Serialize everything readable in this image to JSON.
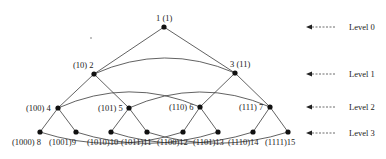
{
  "diagram": {
    "type": "binary-tree-with-cross-links",
    "nodes": [
      {
        "id": 1,
        "label": "1 (1)",
        "x": 164,
        "y": 27,
        "lx": 156,
        "ly": 21,
        "anchor": "start"
      },
      {
        "id": 2,
        "label": "(10) 2",
        "x": 94,
        "y": 74,
        "lx": 73,
        "ly": 68,
        "anchor": "start"
      },
      {
        "id": 3,
        "label": "3 (11)",
        "x": 235,
        "y": 73,
        "lx": 230,
        "ly": 67,
        "anchor": "start"
      },
      {
        "id": 4,
        "label": "(100)  4",
        "x": 58,
        "y": 108,
        "lx": 26,
        "ly": 111,
        "anchor": "start"
      },
      {
        "id": 5,
        "label": "(101) 5",
        "x": 129,
        "y": 108,
        "lx": 98,
        "ly": 111,
        "anchor": "start"
      },
      {
        "id": 6,
        "label": "(110) 6",
        "x": 200,
        "y": 107,
        "lx": 169,
        "ly": 110,
        "anchor": "start"
      },
      {
        "id": 7,
        "label": "(111) 7",
        "x": 270,
        "y": 107,
        "lx": 239,
        "ly": 110,
        "anchor": "start"
      },
      {
        "id": 8,
        "label": "(1000) 8",
        "x": 40,
        "y": 132,
        "lx": 12,
        "ly": 145,
        "anchor": "start"
      },
      {
        "id": 9,
        "label": "(1001)9",
        "x": 76,
        "y": 132,
        "lx": 49,
        "ly": 145,
        "anchor": "start"
      },
      {
        "id": 10,
        "label": "(1010)10",
        "x": 111,
        "y": 132,
        "lx": 87,
        "ly": 145,
        "anchor": "start"
      },
      {
        "id": 11,
        "label": "(1011)11",
        "x": 147,
        "y": 132,
        "lx": 121,
        "ly": 145,
        "anchor": "start"
      },
      {
        "id": 12,
        "label": "(1100)12",
        "x": 183,
        "y": 132,
        "lx": 157,
        "ly": 145,
        "anchor": "start"
      },
      {
        "id": 13,
        "label": "(1101)13",
        "x": 218,
        "y": 132,
        "lx": 193,
        "ly": 145,
        "anchor": "start"
      },
      {
        "id": 14,
        "label": "(1110)14",
        "x": 253,
        "y": 132,
        "lx": 228,
        "ly": 145,
        "anchor": "start"
      },
      {
        "id": 15,
        "label": "(1111)15",
        "x": 288,
        "y": 132,
        "lx": 265,
        "ly": 145,
        "anchor": "start"
      }
    ],
    "tree_edges": [
      [
        1,
        2
      ],
      [
        1,
        3
      ],
      [
        2,
        4
      ],
      [
        2,
        5
      ],
      [
        3,
        6
      ],
      [
        3,
        7
      ],
      [
        4,
        8
      ],
      [
        4,
        9
      ],
      [
        5,
        10
      ],
      [
        5,
        11
      ],
      [
        6,
        12
      ],
      [
        6,
        13
      ],
      [
        7,
        14
      ],
      [
        7,
        15
      ]
    ],
    "cross_links": [
      {
        "from": 2,
        "to": 3,
        "bend": "up"
      },
      {
        "from": 4,
        "to": 6,
        "bend": "up"
      },
      {
        "from": 5,
        "to": 7,
        "bend": "up"
      },
      {
        "from": 8,
        "to": 12,
        "bend": "down"
      },
      {
        "from": 9,
        "to": 13,
        "bend": "down"
      },
      {
        "from": 10,
        "to": 14,
        "bend": "down"
      },
      {
        "from": 11,
        "to": 15,
        "bend": "down"
      }
    ],
    "levels": [
      {
        "label": "Level 0",
        "y": 27
      },
      {
        "label": "Level 1",
        "y": 74
      },
      {
        "label": "Level 2",
        "y": 107
      },
      {
        "label": "Level 3",
        "y": 133
      }
    ]
  }
}
